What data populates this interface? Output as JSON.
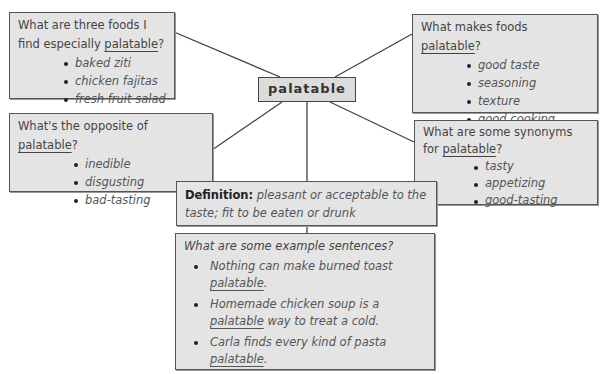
{
  "title_partial": "palatable",
  "center_word": "palatable",
  "boxes": {
    "foods": {
      "question_pre": "What are three foods I find especially",
      "question_word": "palatable",
      "question_post": "?",
      "items": [
        "baked ziti",
        "chicken fajitas",
        "fresh fruit salad"
      ]
    },
    "makes": {
      "question_pre": "What makes foods",
      "question_word": "palatable",
      "question_post": "?",
      "items": [
        "good taste",
        "seasoning",
        "texture",
        "good cooking"
      ]
    },
    "opposite": {
      "question_pre": "What's the opposite of",
      "question_word": "palatable",
      "question_post": "?",
      "items": [
        "inedible",
        "disgusting",
        "bad-tasting"
      ]
    },
    "synonyms": {
      "question_pre": "What are some synonyms for",
      "question_word": "palatable",
      "question_post": "?",
      "items": [
        "tasty",
        "appetizing",
        "good-tasting"
      ]
    },
    "definition": {
      "label": "Definition:",
      "text": "pleasant or acceptable to the taste; fit to be eaten or drunk"
    },
    "examples": {
      "question": "What are some example sentences?",
      "sentences": [
        {
          "pre": "Nothing can make burned toast",
          "word": "palatable",
          "post": "."
        },
        {
          "pre": "Homemade chicken soup is a",
          "word": "palatable",
          "post": "way to treat a cold."
        },
        {
          "pre": "Carla finds every kind of pasta",
          "word": "palatable",
          "post": "."
        }
      ]
    }
  },
  "colors": {
    "box_fill": "#e4e4e4",
    "border": "#555555",
    "line": "#444444"
  }
}
